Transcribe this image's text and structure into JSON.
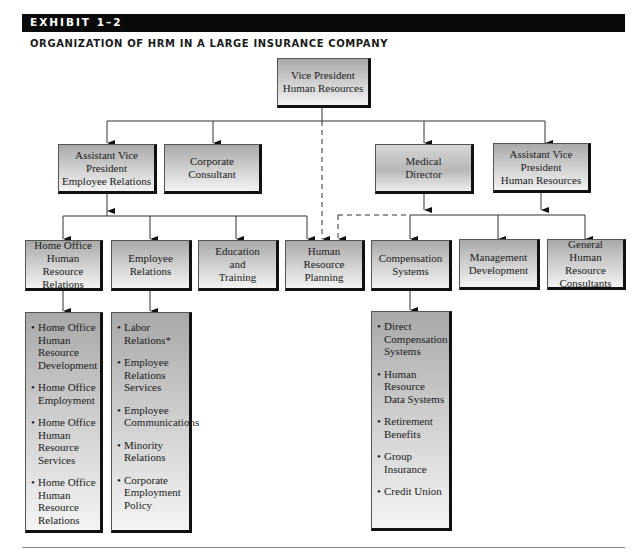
{
  "header": {
    "exhibit_label": "EXHIBIT 1–2",
    "title": "ORGANIZATION OF HRM IN A LARGE INSURANCE COMPANY"
  },
  "colors": {
    "header_bar": "#0a0a0a",
    "box_border": "#111111",
    "connector": "#333333"
  },
  "org": {
    "level1": {
      "vp_hr": "Vice President\nHuman Resources"
    },
    "level2": {
      "avp_employee_relations": "Assistant Vice\nPresident\nEmployee Relations",
      "corporate_consultant": "Corporate\nConsultant",
      "medical_director": "Medical\nDirector",
      "avp_human_resources": "Assistant Vice\nPresident\nHuman Resources"
    },
    "level3": {
      "home_office_hr_relations": "Home Office\nHuman Resource\nRelations",
      "employee_relations": "Employee\nRelations",
      "education_training": "Education\nand\nTraining",
      "hr_planning": "Human\nResource\nPlanning",
      "compensation_systems": "Compensation\nSystems",
      "management_development": "Management\nDevelopment",
      "general_hr_consultants": "General\nHuman Resource\nConsultants"
    },
    "details": {
      "home_office": [
        "Home Office\nHuman\nResource\nDevelopment",
        "Home Office\nEmployment",
        "Home Office\nHuman\nResource\nServices",
        "Home Office\nHuman\nResource\nRelations"
      ],
      "employee_relations": [
        "Labor\nRelations*",
        "Employee\nRelations\nServices",
        "Employee\nCommunications",
        "Minority\nRelations",
        "Corporate\nEmployment\nPolicy"
      ],
      "compensation": [
        "Direct\nCompensation\nSystems",
        "Human\nResource\nData Systems",
        "Retirement\nBenefits",
        "Group\nInsurance",
        "Credit Union"
      ]
    }
  }
}
